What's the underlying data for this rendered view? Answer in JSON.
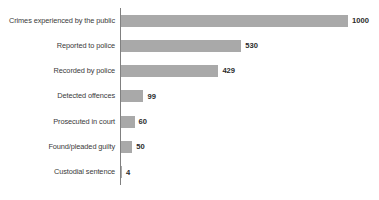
{
  "chart_data": {
    "type": "bar",
    "orientation": "horizontal",
    "title": "",
    "subtitle": "",
    "xlabel": "",
    "ylabel": "",
    "xlim": [
      0,
      1000
    ],
    "grid": false,
    "legend": false,
    "bar_color": "#a9a9a9",
    "axis_color": "#808080",
    "label_color": "#3a3a3a",
    "value_color": "#2b2b2b",
    "categories": [
      "Crimes experienced by the public",
      "Reported to police",
      "Recorded by police",
      "Detected offences",
      "Prosecuted in court",
      "Found/pleaded guilty",
      "Custodial sentence"
    ],
    "values": [
      1000,
      530,
      429,
      99,
      60,
      50,
      4
    ],
    "value_labels": [
      "1000",
      "530",
      "429",
      "99",
      "60",
      "50",
      "4"
    ]
  }
}
